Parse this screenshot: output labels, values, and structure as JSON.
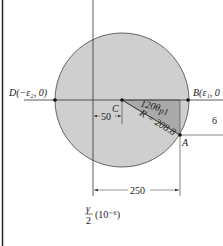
{
  "diagram": {
    "type": "mohr-circle-strain",
    "colors": {
      "circle_fill": "#cfcfcf",
      "triangle_fill": "#a9a9a9",
      "stroke": "#333333",
      "background": "#ffffff"
    },
    "points": {
      "D": {
        "label": "D(−ε₂, 0)"
      },
      "B": {
        "label": "B(ε₁, 0"
      },
      "C": {
        "label": "C"
      },
      "A": {
        "label": "A"
      }
    },
    "angle_label": "120θ",
    "angle_subscript": "p1",
    "radius_label": "R = 208.8",
    "dimensions": {
      "center_offset": "50",
      "a_horizontal": "250",
      "right_partial": "6"
    },
    "vertical_axis_label": {
      "numerator": "γ",
      "denominator": "2",
      "unit": "(10⁻⁶)"
    }
  }
}
